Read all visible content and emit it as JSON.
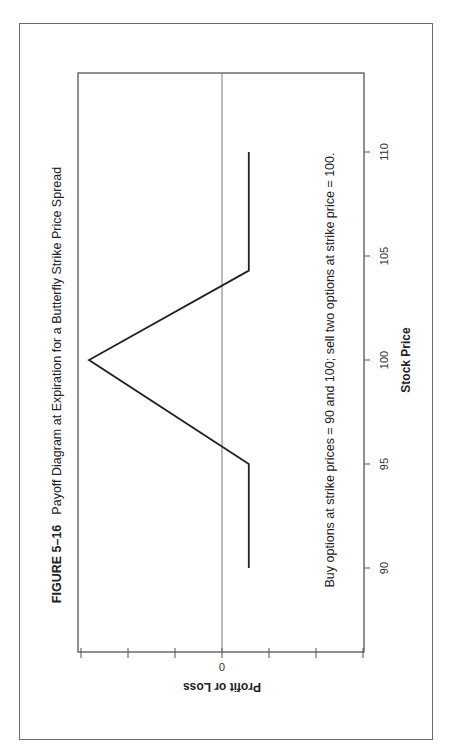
{
  "figure": {
    "number": "FIGURE 5–16",
    "title": "Payoff Diagram at Expiration for a Butterfly Strike Price Spread",
    "annotation": "Buy options at strike prices = 90 and 100; sell two options at strike price = 100."
  },
  "colors": {
    "frame": "#6a6a6a",
    "axis": "#555555",
    "payoff_line": "#222222",
    "zero_line": "#777777",
    "text": "#222222"
  },
  "chart_data": {
    "type": "line",
    "title": "Payoff Diagram at Expiration for a Butterfly Strike Price Spread",
    "xlabel": "Stock Price",
    "ylabel": "Profit or Loss",
    "x_ticks": [
      90,
      95,
      100,
      105,
      110
    ],
    "y_tick_labels": [
      "0"
    ],
    "y_ticks_count": 7,
    "y_zero_tick_index": 3,
    "xlim": [
      87.5,
      112.5
    ],
    "ylim_in_tick_units": [
      -3,
      3
    ],
    "grid": false,
    "orientation_note": "Figure printed rotated 90° counter-clockwise on the page",
    "series": [
      {
        "name": "Butterfly spread payoff",
        "x": [
          90,
          95,
          100,
          104.3,
          110
        ],
        "y_in_tick_units": [
          -0.57,
          -0.57,
          2.83,
          -0.57,
          -0.57
        ]
      }
    ],
    "zero_line": true
  },
  "axes": {
    "x_ticks": [
      {
        "label": "90",
        "value": 90
      },
      {
        "label": "95",
        "value": 95
      },
      {
        "label": "100",
        "value": 100
      },
      {
        "label": "105",
        "value": 105
      },
      {
        "label": "110",
        "value": 110
      }
    ],
    "x_title": "Stock Price",
    "y_zero_label": "0",
    "y_title": "Profit or Loss"
  }
}
